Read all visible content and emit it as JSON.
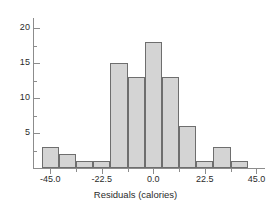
{
  "chart_data": {
    "type": "bar",
    "title": "",
    "subtitle": "",
    "xlabel": "Residuals (calories)",
    "ylabel": "",
    "xlim": [
      -52.5,
      48.75
    ],
    "ylim": [
      0,
      21.5
    ],
    "grid": false,
    "legend": null,
    "bin_width": 7.5,
    "categories": [
      "-48.75 to -41.25",
      "-41.25 to -33.75",
      "-33.75 to -26.25",
      "-26.25 to -18.75",
      "-18.75 to -11.25",
      "-11.25 to -3.75",
      "-3.75 to 3.75",
      "3.75 to 11.25",
      "11.25 to 18.75",
      "18.75 to 26.25",
      "26.25 to 33.75",
      "33.75 to 41.25"
    ],
    "bin_centers": [
      -45.0,
      -37.5,
      -30.0,
      -22.5,
      -15.0,
      -7.5,
      0.0,
      7.5,
      15.0,
      22.5,
      30.0,
      37.5
    ],
    "values": [
      3,
      2,
      1,
      1,
      15,
      13,
      18,
      13,
      6,
      1,
      3,
      1
    ],
    "x_ticks_major": [
      -45.0,
      -22.5,
      0.0,
      22.5,
      45.0
    ],
    "x_tick_labels": [
      "-45.0",
      "-22.5",
      "0.0",
      "22.5",
      "45.0"
    ],
    "x_ticks_minor": [
      -33.75,
      -11.25,
      11.25,
      33.75
    ],
    "y_ticks_major": [
      5,
      10,
      15,
      20
    ],
    "y_tick_labels": [
      "5",
      "10",
      "15",
      "20"
    ],
    "y_ticks_minor": [
      2.5,
      7.5,
      12.5,
      17.5
    ],
    "colors": {
      "bar_fill": "#d4d4d4",
      "bar_stroke": "#6e6e6e",
      "axis": "#8c8c8c",
      "text": "#2b2b2b",
      "background": "#ffffff"
    }
  }
}
